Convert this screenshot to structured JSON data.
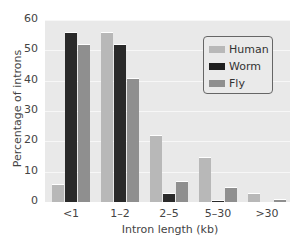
{
  "chart_data": {
    "type": "bar",
    "title": "",
    "xlabel": "Intron length (kb)",
    "ylabel": "Percentage of introns",
    "ylim": [
      0,
      60
    ],
    "yticks": [
      0,
      10,
      20,
      30,
      40,
      50,
      60
    ],
    "categories": [
      "<1",
      "1–2",
      "2–5",
      "5–30",
      ">30"
    ],
    "series": [
      {
        "name": "Human",
        "color": "#b8b8b8",
        "values": [
          6,
          56,
          22,
          15,
          3
        ]
      },
      {
        "name": "Worm",
        "color": "#2a2a2a",
        "values": [
          56,
          52,
          3,
          0.5,
          0
        ]
      },
      {
        "name": "Fly",
        "color": "#8f8f8f",
        "values": [
          52,
          41,
          7,
          5,
          1
        ]
      }
    ],
    "grid": true,
    "legend_position": "upper right"
  },
  "axis": {
    "yticks": [
      "0",
      "10",
      "20",
      "30",
      "40",
      "50",
      "60"
    ],
    "xticks": [
      "<1",
      "1–2",
      "2–5",
      "5–30",
      ">30"
    ],
    "xlabel": "Intron length (kb)",
    "ylabel": "Percentage of introns"
  },
  "legend": [
    "Human",
    "Worm",
    "Fly"
  ]
}
